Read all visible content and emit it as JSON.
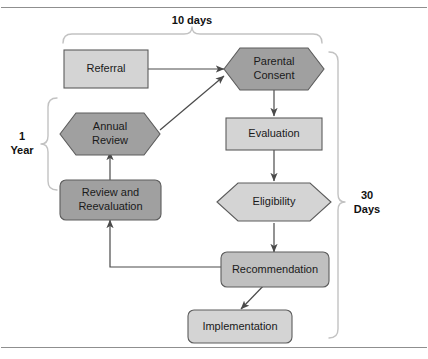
{
  "diagram": {
    "colors": {
      "fill_light": "#d4d4d4",
      "fill_medium": "#c0c0c0",
      "fill_dark": "#a0a0a0",
      "stroke": "#5c5c5c",
      "arrow": "#4a4a4a",
      "brace": "#c2c2c2",
      "rule": "#8f8f8f",
      "text": "#1a1a1a"
    },
    "nodes": [
      {
        "id": "referral",
        "label": "Referral",
        "shape": "rectangle",
        "fill": "light"
      },
      {
        "id": "parental",
        "label_line1": "Parental",
        "label_line2": "Consent",
        "shape": "hexagon",
        "fill": "dark"
      },
      {
        "id": "annual",
        "label_line1": "Annual",
        "label_line2": "Review",
        "shape": "hexagon",
        "fill": "dark"
      },
      {
        "id": "evaluation",
        "label": "Evaluation",
        "shape": "rectangle",
        "fill": "light"
      },
      {
        "id": "eligibility",
        "label": "Eligibility",
        "shape": "hexagon-wide",
        "fill": "light"
      },
      {
        "id": "review",
        "label_line1": "Review and",
        "label_line2": "Reevaluation",
        "shape": "rounded-rectangle",
        "fill": "dark"
      },
      {
        "id": "recommendation",
        "label": "Recommendation",
        "shape": "rounded-rectangle",
        "fill": "medium"
      },
      {
        "id": "implementation",
        "label": "Implementation",
        "shape": "rounded-rectangle",
        "fill": "light"
      }
    ],
    "braces": [
      {
        "id": "ten-days",
        "label": "10 days",
        "orientation": "top",
        "spans": "referral-to-parental-consent"
      },
      {
        "id": "one-year",
        "label_line1": "1",
        "label_line2": "Year",
        "orientation": "left",
        "spans": "annual-review-cycle"
      },
      {
        "id": "thirty-days",
        "label_line1": "30",
        "label_line2": "Days",
        "orientation": "right",
        "spans": "parental-consent-to-implementation"
      }
    ],
    "edges": [
      {
        "from": "referral",
        "to": "parental",
        "style": "straight-horizontal"
      },
      {
        "from": "annual",
        "to": "parental",
        "style": "diagonal"
      },
      {
        "from": "parental",
        "to": "evaluation",
        "style": "straight-vertical"
      },
      {
        "from": "evaluation",
        "to": "eligibility",
        "style": "straight-vertical"
      },
      {
        "from": "eligibility",
        "to": "recommendation",
        "style": "straight-vertical"
      },
      {
        "from": "recommendation",
        "to": "implementation",
        "style": "diagonal"
      },
      {
        "from": "recommendation",
        "to": "review",
        "style": "elbow-feedback"
      },
      {
        "from": "review",
        "to": "annual",
        "style": "straight-vertical-up"
      }
    ]
  }
}
